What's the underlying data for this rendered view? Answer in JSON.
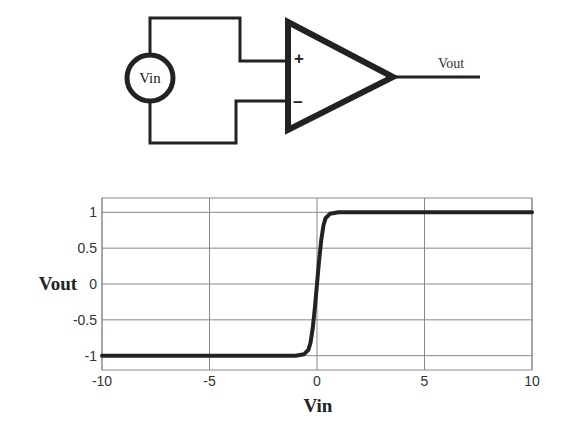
{
  "circuit": {
    "source_label": "Vin",
    "output_label": "Vout",
    "plus_symbol": "+",
    "minus_symbol": "−",
    "stroke_color": "#222222"
  },
  "chart_data": {
    "type": "line",
    "title": "",
    "xlabel": "Vin",
    "ylabel": "Vout",
    "xlim": [
      -10,
      10
    ],
    "ylim": [
      -1.2,
      1.2
    ],
    "grid": true,
    "legend": null,
    "x_ticks": [
      -10,
      -5,
      0,
      5,
      10
    ],
    "x_tick_labels": [
      "-10",
      "-5",
      "0",
      "5",
      "10"
    ],
    "y_ticks": [
      1,
      0.5,
      0,
      -0.5,
      -1
    ],
    "y_tick_labels": [
      "1",
      "0.5",
      "0",
      "-0.5",
      "-1"
    ],
    "series": [
      {
        "name": "Vout",
        "color": "#222222",
        "x": [
          -10,
          -5,
          -1,
          -0.6,
          -0.4,
          -0.3,
          -0.2,
          -0.1,
          0,
          0.1,
          0.2,
          0.3,
          0.4,
          0.6,
          1,
          5,
          10
        ],
        "y": [
          -1,
          -1,
          -1,
          -0.98,
          -0.92,
          -0.82,
          -0.62,
          -0.33,
          0,
          0.33,
          0.62,
          0.82,
          0.92,
          0.98,
          1,
          1,
          1
        ]
      }
    ],
    "annotation": "Steep sigmoid (comparator transfer curve) switching at Vin = 0"
  }
}
